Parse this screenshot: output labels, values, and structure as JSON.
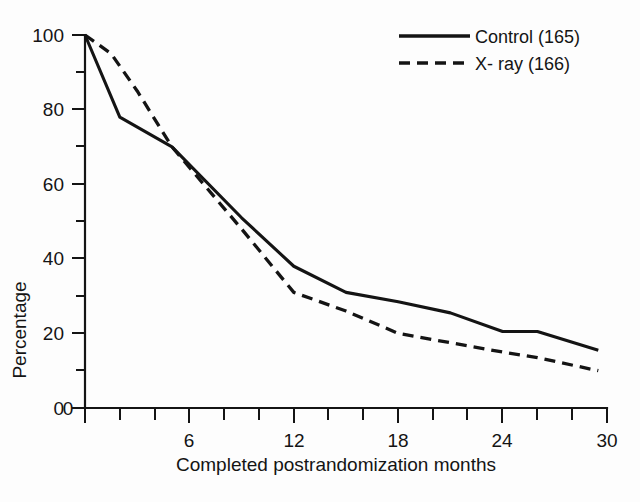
{
  "chart_data": {
    "type": "line",
    "title": "",
    "xlabel": "Completed postrandomization months",
    "ylabel": "Percentage",
    "xlim": [
      0,
      30
    ],
    "ylim": [
      0,
      100
    ],
    "grid": false,
    "legend_position": "top-right",
    "x_ticks_major": [
      0,
      6,
      12,
      18,
      24,
      30
    ],
    "x_tick_labels": [
      "0",
      "6",
      "12",
      "18",
      "24",
      "30"
    ],
    "x_ticks_minor_step": 2,
    "y_ticks_major": [
      0,
      20,
      40,
      60,
      80,
      100
    ],
    "y_tick_labels": [
      "0",
      "20",
      "40",
      "60",
      "80",
      "100"
    ],
    "y_ticks_minor_step": 10,
    "series": [
      {
        "name": "Control (165)",
        "style": "solid",
        "color": "#141414",
        "x": [
          0,
          2,
          5,
          9,
          12,
          15,
          18,
          21,
          24,
          26,
          29.5
        ],
        "values": [
          100,
          78,
          70,
          51,
          38,
          31,
          28.5,
          25.5,
          20.5,
          20.5,
          15.5
        ]
      },
      {
        "name": "X- ray (166)",
        "style": "dashed",
        "color": "#141414",
        "x": [
          0,
          1.5,
          3,
          5,
          9,
          12,
          15,
          18,
          21,
          24,
          26,
          29.5
        ],
        "values": [
          100,
          95,
          85,
          70,
          48,
          31,
          26,
          20,
          17.5,
          15,
          13.5,
          10
        ]
      }
    ],
    "annotations": []
  },
  "legend": {
    "items": [
      {
        "label": "Control (165)",
        "style": "solid"
      },
      {
        "label": "X- ray (166)",
        "style": "dashed"
      }
    ]
  },
  "axes": {
    "x_title": "Completed postrandomization months",
    "y_title": "Percentage"
  }
}
